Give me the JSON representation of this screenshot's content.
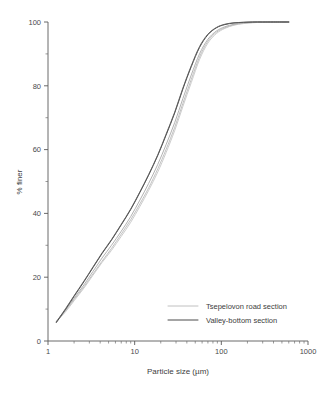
{
  "chart_data": {
    "type": "line",
    "title": "",
    "subtitle": "",
    "xlabel": "Particle size (µm)",
    "ylabel": "% finer",
    "xscale": "log",
    "yscale": "linear",
    "xlim": [
      1,
      1000
    ],
    "ylim": [
      0,
      100
    ],
    "xticks": [
      1,
      10,
      100,
      1000
    ],
    "xtick_labels": [
      "1",
      "10",
      "100",
      "1000"
    ],
    "yticks": [
      0,
      20,
      40,
      60,
      80,
      100
    ],
    "ytick_labels": [
      "0",
      "20",
      "40",
      "60",
      "80",
      "100"
    ],
    "yticks_minor": [
      10,
      30,
      50,
      70,
      90
    ],
    "grid": false,
    "legend_position": "lower-right",
    "annotations": [],
    "series": [
      {
        "name": "Tsepelovon road section",
        "color": "#b9b9b9",
        "width": 0.9,
        "x": [
          1.25,
          1.6,
          2,
          2.6,
          3.3,
          4.2,
          5.4,
          7,
          9,
          11.5,
          14.5,
          18.5,
          23,
          29,
          36,
          45,
          56,
          70,
          88,
          110,
          140,
          180,
          230,
          300,
          400,
          600
        ],
        "y": [
          6,
          9.5,
          13,
          17,
          21,
          25,
          29,
          33.5,
          38,
          43,
          48,
          54,
          60,
          67,
          74.5,
          82,
          89,
          94,
          96.8,
          98.2,
          99.1,
          99.6,
          99.8,
          99.9,
          100,
          100
        ]
      },
      {
        "name": "Tsepelovon road section",
        "color": "#c6c6c6",
        "width": 0.9,
        "x": [
          1.25,
          1.6,
          2,
          2.6,
          3.3,
          4.2,
          5.4,
          7,
          9,
          11.5,
          14.5,
          18.5,
          23,
          29,
          36,
          45,
          56,
          70,
          88,
          110,
          140,
          180,
          230,
          300,
          400,
          600
        ],
        "y": [
          6,
          9.2,
          12.6,
          16.6,
          20.6,
          24.6,
          28.4,
          32.8,
          37.2,
          42.2,
          47.2,
          53,
          59,
          66,
          73.5,
          81,
          88.2,
          93.4,
          96.4,
          98,
          99,
          99.5,
          99.8,
          99.9,
          100,
          100
        ]
      },
      {
        "name": "Tsepelovon road section",
        "color": "#a8a8a8",
        "width": 0.9,
        "x": [
          1.25,
          1.6,
          2,
          2.6,
          3.3,
          4.2,
          5.4,
          7,
          9,
          11.5,
          14.5,
          18.5,
          23,
          29,
          36,
          45,
          56,
          70,
          88,
          110,
          140,
          180,
          230,
          300,
          400,
          600
        ],
        "y": [
          6.2,
          9.8,
          13.4,
          17.6,
          21.8,
          26,
          30,
          34.4,
          39,
          44.2,
          49.4,
          55.4,
          61.5,
          68.5,
          76,
          83.4,
          90,
          94.6,
          97.2,
          98.5,
          99.3,
          99.7,
          99.9,
          100,
          100,
          100
        ]
      },
      {
        "name": "Valley-bottom section",
        "color": "#4a4a4a",
        "width": 1.0,
        "x": [
          1.25,
          1.6,
          2,
          2.6,
          3.3,
          4.2,
          5.4,
          7,
          9,
          11.5,
          14.5,
          18.5,
          23,
          29,
          36,
          45,
          56,
          70,
          88,
          110,
          140,
          180,
          230,
          300,
          400,
          600
        ],
        "y": [
          5.8,
          10,
          14,
          18.6,
          23,
          27.4,
          31.6,
          36.4,
          41.2,
          46.6,
          52,
          58.2,
          64.5,
          71.5,
          79,
          86,
          92,
          96,
          98.2,
          99.2,
          99.7,
          99.9,
          100,
          100,
          100,
          100
        ]
      },
      {
        "name": "Valley-bottom section",
        "color": "#5d5d5d",
        "width": 0.9,
        "x": [
          1.25,
          1.6,
          2,
          2.6,
          3.3,
          4.2,
          5.4,
          7,
          9,
          11.5,
          14.5,
          18.5,
          23,
          29,
          36,
          45,
          56,
          70,
          88,
          110,
          140,
          180,
          230,
          300,
          400,
          600
        ],
        "y": [
          6,
          10.2,
          14.2,
          18.8,
          23.2,
          27.6,
          31.8,
          36.6,
          41.4,
          46.8,
          52.2,
          58.4,
          64.8,
          71.8,
          79.3,
          86.3,
          92.3,
          96.2,
          98.3,
          99.3,
          99.75,
          99.9,
          100,
          100,
          100,
          100
        ]
      }
    ]
  },
  "legend": {
    "entries": [
      {
        "label": "Tsepelovon road section",
        "color": "#b9b9b9"
      },
      {
        "label": "Valley-bottom section",
        "color": "#4a4a4a"
      }
    ]
  },
  "axes": {
    "x_title": "Particle size (µm)",
    "y_title": "% finer",
    "x_tick_labels": [
      "1",
      "10",
      "100",
      "1000"
    ],
    "y_tick_labels": [
      "0",
      "20",
      "40",
      "60",
      "80",
      "100"
    ]
  }
}
